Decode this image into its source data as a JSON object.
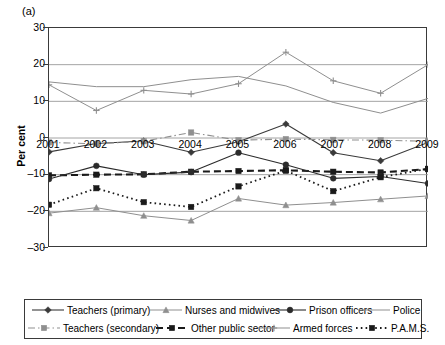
{
  "figure": {
    "panel_label": "(a)",
    "y_axis_title": "Per cent"
  },
  "chart_data": {
    "type": "line",
    "title": "(a)",
    "xlabel": "",
    "ylabel": "Per cent",
    "ylim": [
      -30,
      30
    ],
    "yticks": [
      30,
      20,
      10,
      0,
      -10,
      -20,
      -30
    ],
    "ytick_labels": [
      "30",
      "20",
      "10",
      "0",
      "–10",
      "–20",
      "–30"
    ],
    "grid": true,
    "grid_axis": "y",
    "legend_position": "bottom",
    "categories": [
      "2001",
      "2002",
      "2003",
      "2004",
      "2005",
      "2006",
      "2007",
      "2008",
      "2009"
    ],
    "x": [
      2001,
      2002,
      2003,
      2004,
      2005,
      2006,
      2007,
      2008,
      2009
    ],
    "series": [
      {
        "name": "Teachers (primary)",
        "color": "#3a3a3a",
        "marker": "diamond",
        "dash": "solid",
        "width": 1.1,
        "values": [
          -3.8,
          -1.5,
          -0.8,
          -3.9,
          -1.0,
          3.8,
          -4.0,
          -6.2,
          -1.2
        ]
      },
      {
        "name": "Teachers (secondary)",
        "color": "#8f8f8f",
        "marker": "square",
        "dash": "dashdot",
        "width": 1.1,
        "values": [
          -1.2,
          -1.6,
          -0.9,
          1.5,
          -0.6,
          -0.3,
          -0.5,
          -0.6,
          -0.9
        ]
      },
      {
        "name": "Nurses and midwives",
        "color": "#8f8f8f",
        "marker": "triangle",
        "dash": "solid",
        "width": 1.0,
        "values": [
          -20.5,
          -19.0,
          -21.2,
          -22.5,
          -16.5,
          -18.3,
          -17.6,
          -16.7,
          -15.8
        ]
      },
      {
        "name": "Other public sector",
        "color": "#1a1a1a",
        "marker": "square",
        "dash": "dashed",
        "width": 2.1,
        "values": [
          -10.2,
          -10.0,
          -9.9,
          -9.2,
          -9.0,
          -8.8,
          -9.2,
          -9.4,
          -8.5
        ]
      },
      {
        "name": "Prison officers",
        "color": "#2b2b2b",
        "marker": "circle",
        "dash": "solid",
        "width": 1.1,
        "values": [
          -11.2,
          -7.6,
          -10.0,
          -9.3,
          -4.0,
          -7.3,
          -11.0,
          -10.5,
          -12.4
        ]
      },
      {
        "name": "Armed forces",
        "color": "#8f8f8f",
        "marker": "plus",
        "dash": "solid",
        "width": 1.0,
        "values": [
          14.5,
          7.5,
          13.0,
          12.0,
          14.8,
          23.4,
          15.6,
          12.2,
          20.0
        ]
      },
      {
        "name": "Police",
        "color": "#8f8f8f",
        "marker": "none",
        "dash": "solid",
        "width": 1.0,
        "values": [
          15.3,
          14.0,
          14.0,
          15.9,
          16.8,
          14.2,
          9.7,
          6.8,
          10.8
        ]
      },
      {
        "name": "P.A.M.S.",
        "color": "#1a1a1a",
        "marker": "square",
        "dash": "dotted",
        "width": 1.8,
        "values": [
          -18.2,
          -13.7,
          -17.5,
          -18.8,
          -13.2,
          -8.9,
          -14.5,
          -10.7,
          -8.4
        ]
      }
    ]
  },
  "legend": {
    "row1": [
      "Teachers (primary)",
      "Nurses and midwives",
      "Prison officers",
      "Police"
    ],
    "row2": [
      "Teachers (secondary)",
      "Other public sector",
      "Armed forces",
      "P.A.M.S."
    ]
  }
}
